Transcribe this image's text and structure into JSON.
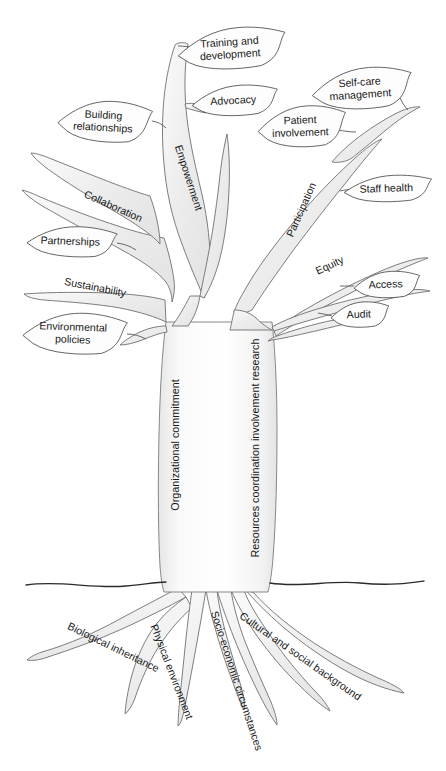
{
  "diagram": {
    "ground_label": "ground-line",
    "colors": {
      "branch_fill": "#efefef",
      "branch_stroke": "#6f6f6f",
      "leaf_fill": "#fdfdfd",
      "leaf_stroke": "#585858",
      "ground_stroke": "#2b2b2b",
      "text": "#171717"
    }
  },
  "leaves": [
    {
      "id": "training-and-development",
      "label": "Training and development",
      "lines": [
        "Training and",
        "development"
      ],
      "x": 232,
      "y": 49,
      "w": 108,
      "h": 42,
      "rotate": -4,
      "side": "right"
    },
    {
      "id": "advocacy",
      "label": "Advocacy",
      "lines": [
        "Advocacy"
      ],
      "x": 235,
      "y": 101,
      "w": 86,
      "h": 31,
      "rotate": -3,
      "side": "right"
    },
    {
      "id": "self-care-management",
      "label": "Self-care management",
      "lines": [
        "Self-care",
        "management"
      ],
      "x": 362,
      "y": 89,
      "w": 100,
      "h": 42,
      "rotate": -4,
      "side": "right"
    },
    {
      "id": "patient-involvement",
      "label": "Patient involvement",
      "lines": [
        "Patient",
        "involvement"
      ],
      "x": 302,
      "y": 127,
      "w": 88,
      "h": 42,
      "rotate": -2,
      "side": "right"
    },
    {
      "id": "building-relationships",
      "label": "Building relationships",
      "lines": [
        "Building",
        "relationships"
      ],
      "x": 105,
      "y": 122,
      "w": 94,
      "h": 42,
      "rotate": 3,
      "side": "left"
    },
    {
      "id": "staff-health",
      "label": "Staff health",
      "lines": [
        "Staff health"
      ],
      "x": 388,
      "y": 189,
      "w": 88,
      "h": 27,
      "rotate": -2,
      "side": "right"
    },
    {
      "id": "partnerships",
      "label": "Partnerships",
      "lines": [
        "Partnerships"
      ],
      "x": 72,
      "y": 242,
      "w": 90,
      "h": 31,
      "rotate": 2,
      "side": "left"
    },
    {
      "id": "access",
      "label": "Access",
      "lines": [
        "Access"
      ],
      "x": 387,
      "y": 285,
      "w": 66,
      "h": 27,
      "rotate": -2,
      "side": "right"
    },
    {
      "id": "audit",
      "label": "Audit",
      "lines": [
        "Audit"
      ],
      "x": 360,
      "y": 315,
      "w": 58,
      "h": 26,
      "rotate": -2,
      "side": "right"
    },
    {
      "id": "environmental-policies",
      "label": "Environmental policies",
      "lines": [
        "Environmental",
        "policies"
      ],
      "x": 75,
      "y": 334,
      "w": 104,
      "h": 42,
      "rotate": 2,
      "side": "left"
    }
  ],
  "branches": [
    {
      "id": "empowerment",
      "label": "Empowerment",
      "x": 188,
      "y": 178,
      "rotate": 72
    },
    {
      "id": "collaboration",
      "label": "Collaboration",
      "x": 113,
      "y": 207,
      "rotate": 24
    },
    {
      "id": "sustainability",
      "label": "Sustainability",
      "x": 95,
      "y": 288,
      "rotate": 11
    },
    {
      "id": "participation",
      "label": "Participation",
      "x": 302,
      "y": 210,
      "rotate": -66
    },
    {
      "id": "equity",
      "label": "Equity",
      "x": 330,
      "y": 266,
      "rotate": -25
    }
  ],
  "trunk_labels": [
    {
      "id": "organizational-commitment",
      "label": "Organizational commitment",
      "x": 176,
      "y": 445,
      "rotate": -90
    },
    {
      "id": "resources-coordination-involvement-research",
      "label": "Resources coordination involvement research",
      "x": 256,
      "y": 448,
      "rotate": -90
    }
  ],
  "roots": [
    {
      "id": "biological-inheritance",
      "label": "Biological inheritance",
      "x": 113,
      "y": 648,
      "rotate": 26
    },
    {
      "id": "physical-environment",
      "label": "Physical environment",
      "x": 171,
      "y": 672,
      "rotate": 69
    },
    {
      "id": "socio-economic-circumstances",
      "label": "Socio-economic circumstances",
      "x": 236,
      "y": 681,
      "rotate": 72
    },
    {
      "id": "cultural-and-social-background",
      "label": "Cultural and social background",
      "x": 300,
      "y": 657,
      "rotate": 35
    }
  ]
}
